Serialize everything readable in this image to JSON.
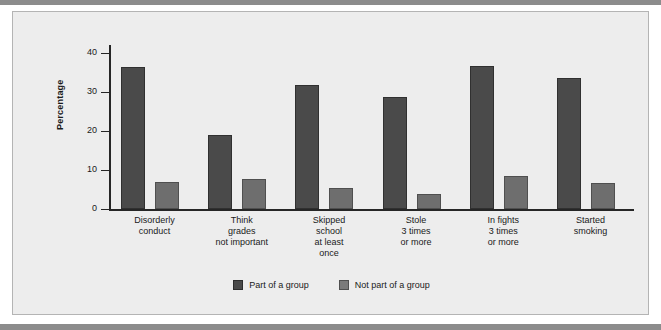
{
  "chart_data": {
    "type": "bar",
    "title": "",
    "xlabel": "",
    "ylabel": "Percentage",
    "ylim": [
      0,
      42
    ],
    "yticks": [
      0,
      10,
      20,
      30,
      40
    ],
    "grid": false,
    "legend_position": "bottom-center",
    "categories": [
      "Disorderly\nconduct",
      "Think\ngrades\nnot important",
      "Skipped\nschool\nat least\nonce",
      "Stole\n3 times\nor more",
      "In fights\n3 times\nor more",
      "Started\nsmoking"
    ],
    "category_lines": [
      [
        "Disorderly",
        "conduct"
      ],
      [
        "Think",
        "grades",
        "not important"
      ],
      [
        "Skipped",
        "school",
        "at least",
        "once"
      ],
      [
        "Stole",
        "3 times",
        "or more"
      ],
      [
        "In fights",
        "3 times",
        "or more"
      ],
      [
        "Started",
        "smoking"
      ]
    ],
    "series": [
      {
        "name": "Part of a group",
        "color": "#4a4a4a",
        "values": [
          36.3,
          18.9,
          31.8,
          28.6,
          36.5,
          33.5
        ]
      },
      {
        "name": "Not part of a group",
        "color": "#6e6e6e",
        "values": [
          6.8,
          7.8,
          5.3,
          3.9,
          8.5,
          6.6
        ]
      }
    ]
  },
  "colors": {
    "panel_background": "#ededed",
    "panel_border": "#b4b4b4",
    "rule": "#8c8c8c",
    "axis": "#262626",
    "text": "#1a1a1a"
  }
}
